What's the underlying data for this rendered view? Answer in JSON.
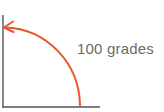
{
  "diagram": {
    "label": "100 grades",
    "angle_value": 100,
    "angle_unit": "grades",
    "colors": {
      "arc": "#e8562a",
      "axes": "#555555",
      "text": "#6b6b6b"
    }
  }
}
